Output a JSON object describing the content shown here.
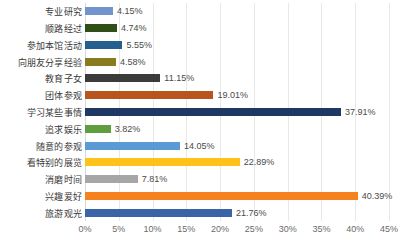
{
  "chart_data": {
    "type": "bar",
    "orientation": "horizontal",
    "title": "",
    "subtitle": "",
    "xlabel": "",
    "ylabel": "",
    "xlim": [
      0,
      45
    ],
    "grid": true,
    "legend": "none",
    "value_suffix": "%",
    "tick_labels": [
      "0%",
      "5%",
      "10%",
      "15%",
      "20%",
      "25%",
      "30%",
      "35%",
      "40%",
      "45%"
    ],
    "tick_values": [
      0,
      5,
      10,
      15,
      20,
      25,
      30,
      35,
      40,
      45
    ],
    "categories": [
      "专业研究",
      "顺路经过",
      "参加本馆活动",
      "向朋友分享经验",
      "教育子女",
      "团体参观",
      "学习某些事情",
      "追求娱乐",
      "随意的参观",
      "看特别的展览",
      "消磨时间",
      "兴趣爱好",
      "旅游观光"
    ],
    "values": [
      4.15,
      4.74,
      5.55,
      4.58,
      11.15,
      19.01,
      37.91,
      3.82,
      14.05,
      22.89,
      7.81,
      40.39,
      21.76
    ],
    "value_labels": [
      "4.15%",
      "4.74%",
      "5.55%",
      "4.58%",
      "11.15%",
      "19.01%",
      "37.91%",
      "3.82%",
      "14.05%",
      "22.89%",
      "7.81%",
      "40.39%",
      "21.76%"
    ],
    "colors": [
      "#7293cb",
      "#2f4f16",
      "#255f8e",
      "#8a7b1f",
      "#3b3b3b",
      "#b8541d",
      "#1f3864",
      "#5f9e3f",
      "#5b9bd5",
      "#ffc219",
      "#a6a6a6",
      "#f5821f",
      "#3a63a8"
    ],
    "bars": [
      {
        "category": "专业研究",
        "value": 4.15,
        "label": "4.15%",
        "color": "#7293cb"
      },
      {
        "category": "顺路经过",
        "value": 4.74,
        "label": "4.74%",
        "color": "#2f4f16"
      },
      {
        "category": "参加本馆活动",
        "value": 5.55,
        "label": "5.55%",
        "color": "#255f8e"
      },
      {
        "category": "向朋友分享经验",
        "value": 4.58,
        "label": "4.58%",
        "color": "#8a7b1f"
      },
      {
        "category": "教育子女",
        "value": 11.15,
        "label": "11.15%",
        "color": "#3b3b3b"
      },
      {
        "category": "团体参观",
        "value": 19.01,
        "label": "19.01%",
        "color": "#b8541d"
      },
      {
        "category": "学习某些事情",
        "value": 37.91,
        "label": "37.91%",
        "color": "#1f3864"
      },
      {
        "category": "追求娱乐",
        "value": 3.82,
        "label": "3.82%",
        "color": "#5f9e3f"
      },
      {
        "category": "随意的参观",
        "value": 14.05,
        "label": "14.05%",
        "color": "#5b9bd5"
      },
      {
        "category": "看特别的展览",
        "value": 22.89,
        "label": "22.89%",
        "color": "#ffc219"
      },
      {
        "category": "消磨时间",
        "value": 7.81,
        "label": "7.81%",
        "color": "#a6a6a6"
      },
      {
        "category": "兴趣爱好",
        "value": 40.39,
        "label": "40.39%",
        "color": "#f5821f"
      },
      {
        "category": "旅游观光",
        "value": 21.76,
        "label": "21.76%",
        "color": "#3a63a8"
      }
    ]
  }
}
